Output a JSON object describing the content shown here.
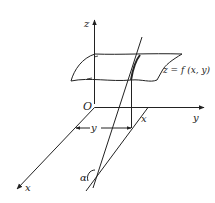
{
  "diagram": {
    "title": "",
    "labels": {
      "z_axis": "z",
      "y_axis": "y",
      "x_axis": "x",
      "origin": "O",
      "surface": "z = f (x, y)",
      "point_x": "x",
      "dim_y": "y",
      "angle": "α"
    },
    "colors": {
      "stroke": "#222222",
      "background": "#ffffff"
    }
  }
}
